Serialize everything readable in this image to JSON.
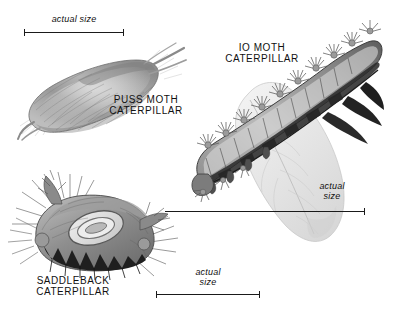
{
  "plate": {
    "title": "Stinging caterpillars illustration plate",
    "background_color": "#ffffff",
    "ink_color": "#1a1a1a",
    "width": 394,
    "height": 322
  },
  "labels": {
    "puss_moth": "PUSS MOTH\nCATERPILLAR",
    "io_moth": "IO MOTH\nCATERPILLAR",
    "saddleback": "SADDLEBACK\nCATERPILLAR"
  },
  "scales": {
    "top": {
      "text": "actual size",
      "orientation": "one-line"
    },
    "right": {
      "text": "actual\nsize",
      "orientation": "two-line"
    },
    "bottom": {
      "text": "actual\nsize",
      "orientation": "two-line"
    }
  },
  "figures": {
    "puss_moth_caterpillar": "furry tapered oval body tilted up to the right with dense hair tufts and a pointed tail",
    "io_moth_caterpillar": "diagonal segmented body bearing rows of branched spiny tufts, resting on a pale veined leaf",
    "saddleback_caterpillar": "stout body with an oval saddle marking, dark spiny flanks and bristled horn clusters at both ends"
  }
}
